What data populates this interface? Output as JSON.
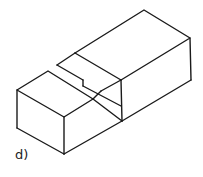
{
  "figure": {
    "label": "d)",
    "stroke_color": "#1a1a1a",
    "background": "#ffffff"
  }
}
